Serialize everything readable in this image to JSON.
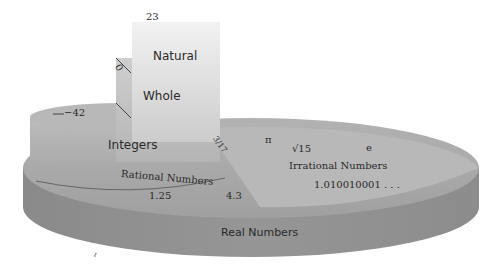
{
  "diagram": {
    "sets": [
      {
        "name": "Real Numbers",
        "example_values": []
      },
      {
        "name": "Rational Numbers",
        "example_values": [
          "1.25",
          "4.3",
          "3/17"
        ]
      },
      {
        "name": "Irrational Numbers",
        "example_values": [
          "π",
          "√15",
          "e",
          "1.010010001 . . ."
        ]
      },
      {
        "name": "Integers",
        "example_values": [
          "−42"
        ]
      },
      {
        "name": "Whole",
        "example_values": [
          "0"
        ]
      },
      {
        "name": "Natural",
        "example_values": [
          "23"
        ]
      }
    ],
    "labels": {
      "real": "Real Numbers",
      "rational": "Rational Numbers",
      "irrational": "Irrational Numbers",
      "integers": "Integers",
      "whole": "Whole",
      "natural": "Natural"
    },
    "values": {
      "natural": "23",
      "whole": "0",
      "integer": "−42",
      "fraction": "3/17",
      "rational_1": "1.25",
      "rational_2": "4.3",
      "pi": "π",
      "sqrt": "√15",
      "e": "e",
      "irrational_decimal": "1.010010001 . . .",
      "stray_mark": "ι"
    },
    "colors": {
      "base_top": "#a9a9a9",
      "base_side": "#8e8e8e",
      "irrational_top": "#b9b9b9",
      "integers": "#b0b0b0",
      "whole": "#c0c0c0",
      "natural": "#dcdcdc",
      "text": "#2a2a2a"
    }
  }
}
